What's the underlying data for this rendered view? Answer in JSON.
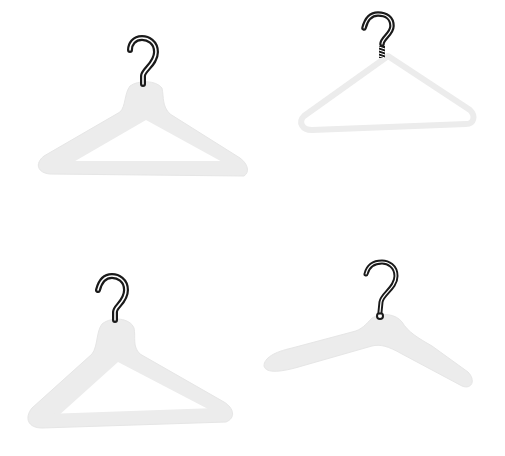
{
  "scene": {
    "description": "Four light-gray clothes hangers with dark question-mark shaped hooks on a white background",
    "background_color": "#ffffff",
    "body_color": "#ececec",
    "body_edge_color": "#e2e2e2",
    "hook_color": "#1a1a1a",
    "hook_highlight_color": "#ffffff",
    "hangers": [
      {
        "position": "top-left",
        "style": "wide shaped wooden hanger with bar",
        "hook_type": "plain hook"
      },
      {
        "position": "top-right",
        "style": "thin wire hanger",
        "hook_type": "screw hook"
      },
      {
        "position": "bottom-left",
        "style": "wide shaped hanger with bar",
        "hook_type": "plain hook"
      },
      {
        "position": "bottom-right",
        "style": "open shoulder hanger without bar",
        "hook_type": "hook with ball tip"
      }
    ]
  }
}
